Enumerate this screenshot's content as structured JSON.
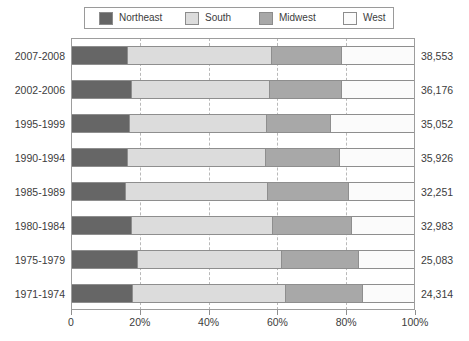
{
  "legend": {
    "position": "top",
    "items": [
      {
        "label": "Northeast",
        "color": "#666666"
      },
      {
        "label": "South",
        "color": "#dcdcdc"
      },
      {
        "label": "Midwest",
        "color": "#a8a8a8"
      },
      {
        "label": "West",
        "color": "#fbfbfb"
      }
    ]
  },
  "chart_data": {
    "type": "bar",
    "orientation": "horizontal",
    "stacked": true,
    "normalized": true,
    "title": "",
    "xlabel": "",
    "ylabel": "",
    "xlim": [
      0,
      100
    ],
    "grid": true,
    "xticks": [
      "0",
      "20%",
      "40%",
      "60%",
      "80%",
      "100%"
    ],
    "xtick_values": [
      0,
      20,
      40,
      60,
      80,
      100
    ],
    "categories": [
      "2007-2008",
      "2002-2006",
      "1995-1999",
      "1990-1994",
      "1985-1989",
      "1980-1984",
      "1975-1979",
      "1971-1974"
    ],
    "series": [
      {
        "name": "Northeast",
        "color": "#666666",
        "values": [
          16.6,
          17.7,
          17.2,
          16.7,
          15.9,
          17.7,
          19.6,
          17.9
        ]
      },
      {
        "name": "South",
        "color": "#dcdcdc",
        "values": [
          41.8,
          40.2,
          39.9,
          39.9,
          41.5,
          41.1,
          41.7,
          44.6
        ]
      },
      {
        "name": "Midwest",
        "color": "#a8a8a8",
        "values": [
          20.4,
          20.9,
          18.4,
          21.6,
          23.4,
          23.0,
          22.5,
          22.3
        ]
      },
      {
        "name": "West",
        "color": "#fbfbfb",
        "values": [
          21.2,
          21.2,
          24.5,
          21.8,
          19.2,
          18.2,
          16.2,
          15.2
        ]
      }
    ],
    "totals": [
      "38,553",
      "36,176",
      "35,052",
      "35,926",
      "32,251",
      "32,983",
      "25,083",
      "24,314"
    ],
    "annotations": {
      "row_totals_position": "right"
    }
  }
}
